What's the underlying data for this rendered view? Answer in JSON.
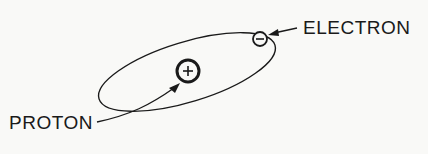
{
  "diagram": {
    "title": "",
    "labels": {
      "electron": "ELECTRON",
      "proton": "PROTON"
    },
    "symbols": {
      "proton_charge": "+",
      "electron_charge": "−"
    },
    "colors": {
      "ink": "#1a1a1a",
      "background": "#f9f9f7"
    }
  }
}
